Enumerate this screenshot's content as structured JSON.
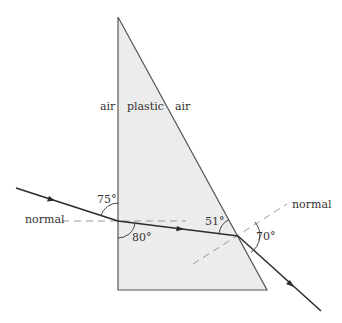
{
  "diagram": {
    "colors": {
      "prism_fill": "#ececec",
      "prism_stroke": "#555555",
      "ray": "#2a2a2a",
      "normal": "#999999",
      "text": "#333333"
    },
    "labels": {
      "air_left": "air",
      "plastic": "plastic",
      "air_right": "air",
      "normal_left": "normal",
      "normal_right": "normal"
    },
    "angles": {
      "incidence_from_surface": "75°",
      "refraction_from_surface": "80°",
      "internal_at_exit": "51°",
      "exit_angle": "70°"
    },
    "geometry": {
      "prism": {
        "top": [
          118,
          17
        ],
        "bottom_left": [
          118,
          290
        ],
        "bottom_right": [
          267,
          290
        ]
      },
      "entry_point": [
        118,
        221
      ],
      "exit_point": [
        238,
        236
      ]
    }
  }
}
